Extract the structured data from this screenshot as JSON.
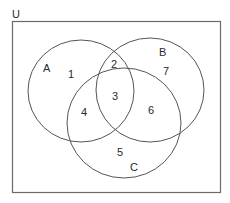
{
  "diagram": {
    "type": "venn",
    "universe_label": "U",
    "sets": [
      {
        "name": "A",
        "label": "A"
      },
      {
        "name": "B",
        "label": "B"
      },
      {
        "name": "C",
        "label": "C"
      }
    ],
    "regions": [
      {
        "label": "1",
        "sets": [
          "A"
        ]
      },
      {
        "label": "2",
        "sets": [
          "A",
          "B"
        ]
      },
      {
        "label": "3",
        "sets": [
          "A",
          "B",
          "C"
        ]
      },
      {
        "label": "4",
        "sets": [
          "A",
          "C"
        ]
      },
      {
        "label": "5",
        "sets": [
          "C"
        ]
      },
      {
        "label": "6",
        "sets": [
          "B",
          "C"
        ]
      },
      {
        "label": "7",
        "sets": [
          "B"
        ]
      }
    ],
    "colors": {
      "stroke": "#555555",
      "text": "#2a2a2a",
      "background": "#ffffff"
    }
  }
}
